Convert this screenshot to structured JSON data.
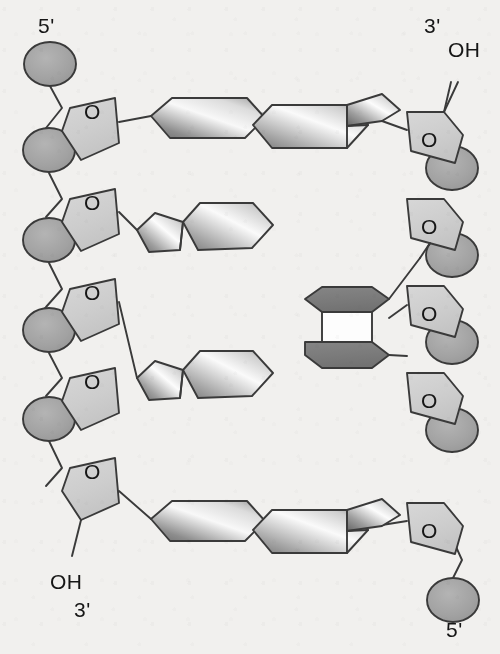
{
  "figure": {
    "type": "molecular-structure-diagram",
    "background_color": "#f1f0ee",
    "stroke_color": "#3a3a3a",
    "width": 500,
    "height": 654
  },
  "palette": {
    "phosphate_fill": "#a3a3a3",
    "sugar_fill": "#cfcfcf",
    "base_light_1": "#6e6e6e",
    "base_light_2": "#fbfbfb",
    "dimer_fill": "#7d7d7d",
    "cyclobutane_fill": "#fdfdfd",
    "outline": "#3a3a3a",
    "text": "#161616"
  },
  "labels": {
    "top_left_end": "5'",
    "top_right_end": "3'",
    "top_right_hydroxyl": "OH",
    "bottom_left_end": "3'",
    "bottom_left_hydroxyl": "OH",
    "bottom_right_end": "5'",
    "sugar_ring_oxygen": "O"
  },
  "strands": [
    {
      "name": "left-strand",
      "polarity_top": "5'",
      "polarity_bottom": "3'",
      "terminal_hydroxyl": "OH",
      "terminal_hydroxyl_position": "bottom",
      "phosphate_count": 4,
      "sugar_count": 4,
      "bases": [
        {
          "index": 1,
          "kind": "pyrimidine",
          "shape": "hexagon",
          "paired": true
        },
        {
          "index": 2,
          "kind": "purine",
          "shape": "fused-pentagon-hexagon",
          "paired": false
        },
        {
          "index": 3,
          "kind": "purine",
          "shape": "fused-pentagon-hexagon",
          "paired": false
        },
        {
          "index": 4,
          "kind": "pyrimidine",
          "shape": "hexagon",
          "paired": true
        }
      ]
    },
    {
      "name": "right-strand",
      "polarity_top": "3'",
      "polarity_bottom": "5'",
      "terminal_hydroxyl": "OH",
      "terminal_hydroxyl_position": "top",
      "phosphate_count": 4,
      "sugar_count": 4,
      "bases": [
        {
          "index": 1,
          "kind": "purine",
          "shape": "fused-hexagon-pentagon",
          "paired": true
        },
        {
          "index": 2,
          "kind": "thymine-dimer-upper",
          "shape": "hexagon-dark",
          "paired": false
        },
        {
          "index": 3,
          "kind": "thymine-dimer-lower",
          "shape": "hexagon-dark",
          "paired": false
        },
        {
          "index": 4,
          "kind": "purine",
          "shape": "fused-hexagon-pentagon",
          "paired": true
        }
      ]
    }
  ],
  "lesion": {
    "name": "cyclobutane pyrimidine dimer",
    "location": "right strand, bases 2 and 3",
    "ring": "cyclobutane",
    "ring_fill": "#fdfdfd",
    "bases_fill": "#7d7d7d",
    "hydrogen_bonded_to_opposite_strand": false
  },
  "base_pairs": [
    {
      "row": 1,
      "left_base": "pyrimidine",
      "right_base": "purine",
      "bonded": true
    },
    {
      "row": 2,
      "left_base": "purine",
      "right_base": "thymine-dimer-upper",
      "bonded": false
    },
    {
      "row": 3,
      "left_base": "purine",
      "right_base": "thymine-dimer-lower",
      "bonded": false
    },
    {
      "row": 4,
      "left_base": "pyrimidine",
      "right_base": "purine",
      "bonded": true
    }
  ]
}
